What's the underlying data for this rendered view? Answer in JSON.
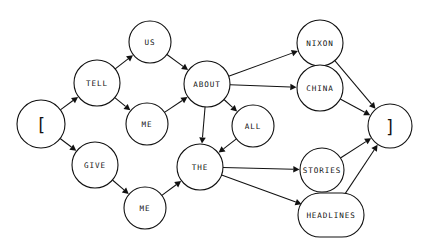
{
  "diagram": {
    "type": "directed-graph",
    "background_color": "#ffffff",
    "stroke_color": "#111111",
    "nodes": [
      {
        "id": "start",
        "label": "[",
        "x": 41,
        "y": 124,
        "rx": 24,
        "ry": 24,
        "shape": "circle"
      },
      {
        "id": "tell",
        "label": "TELL",
        "x": 97,
        "y": 83,
        "rx": 23,
        "ry": 23,
        "shape": "circle"
      },
      {
        "id": "give",
        "label": "GIVE",
        "x": 95,
        "y": 165,
        "rx": 23,
        "ry": 23,
        "shape": "circle"
      },
      {
        "id": "us",
        "label": "US",
        "x": 150,
        "y": 42,
        "rx": 21,
        "ry": 21,
        "shape": "circle"
      },
      {
        "id": "me_top",
        "label": "ME",
        "x": 147,
        "y": 124,
        "rx": 21,
        "ry": 21,
        "shape": "circle"
      },
      {
        "id": "me_bottom",
        "label": "ME",
        "x": 145,
        "y": 208,
        "rx": 21,
        "ry": 21,
        "shape": "circle"
      },
      {
        "id": "about",
        "label": "ABOUT",
        "x": 207,
        "y": 84,
        "rx": 23,
        "ry": 23,
        "shape": "circle"
      },
      {
        "id": "all",
        "label": "ALL",
        "x": 253,
        "y": 126,
        "rx": 21,
        "ry": 21,
        "shape": "circle"
      },
      {
        "id": "the",
        "label": "THE",
        "x": 200,
        "y": 167,
        "rx": 23,
        "ry": 23,
        "shape": "circle"
      },
      {
        "id": "nixon",
        "label": "NIXON",
        "x": 320,
        "y": 43,
        "rx": 23,
        "ry": 23,
        "shape": "circle"
      },
      {
        "id": "china",
        "label": "CHINA",
        "x": 320,
        "y": 88,
        "rx": 23,
        "ry": 23,
        "shape": "circle"
      },
      {
        "id": "stories",
        "label": "STORIES",
        "x": 322,
        "y": 170,
        "rx": 22,
        "ry": 22,
        "shape": "circle"
      },
      {
        "id": "headlines",
        "label": "HEADLINES",
        "x": 331,
        "y": 215,
        "rx": 33,
        "ry": 22,
        "shape": "rounded-rect"
      },
      {
        "id": "end",
        "label": "]",
        "x": 390,
        "y": 126,
        "rx": 22,
        "ry": 22,
        "shape": "circle"
      }
    ],
    "edges": [
      {
        "from": "start",
        "to": "tell"
      },
      {
        "from": "start",
        "to": "give"
      },
      {
        "from": "tell",
        "to": "us"
      },
      {
        "from": "tell",
        "to": "me_top"
      },
      {
        "from": "us",
        "to": "about"
      },
      {
        "from": "me_top",
        "to": "about"
      },
      {
        "from": "give",
        "to": "me_bottom"
      },
      {
        "from": "me_bottom",
        "to": "the"
      },
      {
        "from": "about",
        "to": "nixon"
      },
      {
        "from": "about",
        "to": "china"
      },
      {
        "from": "about",
        "to": "all"
      },
      {
        "from": "about",
        "to": "the"
      },
      {
        "from": "all",
        "to": "the"
      },
      {
        "from": "the",
        "to": "stories"
      },
      {
        "from": "the",
        "to": "headlines"
      },
      {
        "from": "nixon",
        "to": "end"
      },
      {
        "from": "china",
        "to": "end"
      },
      {
        "from": "stories",
        "to": "end"
      },
      {
        "from": "headlines",
        "to": "end"
      }
    ]
  }
}
